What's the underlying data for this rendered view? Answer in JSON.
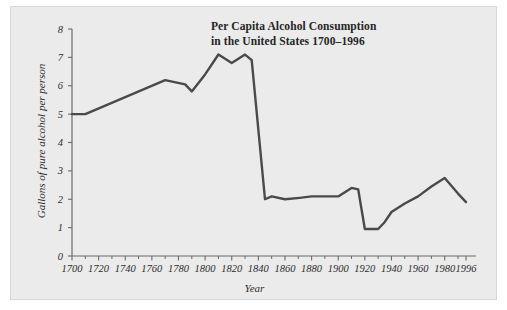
{
  "chart_data": {
    "type": "line",
    "title": "Per Capita Alcohol Consumption in the United States 1700–1996",
    "title_lines": [
      "Per Capita Alcohol Consumption",
      "in the United States 1700–1996"
    ],
    "xlabel": "Year",
    "ylabel": "Gallons of pure alcohol per person",
    "xlim": [
      1700,
      1996
    ],
    "ylim": [
      0,
      8
    ],
    "grid": false,
    "legend": null,
    "line_color": "#4a4a4a",
    "panel_color": "#ebebeb",
    "axis_color": "#6b6b6b",
    "xticks": [
      1700,
      1720,
      1740,
      1760,
      1780,
      1800,
      1820,
      1840,
      1860,
      1880,
      1900,
      1920,
      1940,
      1960,
      1980,
      1996
    ],
    "xtick_labels": [
      "1700",
      "1720",
      "1740",
      "1760",
      "1780",
      "1800",
      "1820",
      "1840",
      "1860",
      "1880",
      "1900",
      "1920",
      "1940",
      "1960",
      "1980",
      "1996"
    ],
    "yticks": [
      0,
      1,
      2,
      3,
      4,
      5,
      6,
      7,
      8
    ],
    "ytick_labels": [
      "0",
      "1",
      "2",
      "3",
      "4",
      "5",
      "6",
      "7",
      "8"
    ],
    "x": [
      1700,
      1710,
      1770,
      1785,
      1790,
      1800,
      1810,
      1820,
      1830,
      1835,
      1845,
      1850,
      1860,
      1871,
      1880,
      1890,
      1900,
      1910,
      1915,
      1920,
      1930,
      1935,
      1940,
      1950,
      1960,
      1970,
      1980,
      1990,
      1996
    ],
    "values": [
      5.0,
      5.0,
      6.2,
      6.05,
      5.8,
      6.4,
      7.1,
      6.8,
      7.1,
      6.9,
      2.0,
      2.1,
      2.0,
      2.05,
      2.1,
      2.1,
      2.1,
      2.4,
      2.35,
      0.95,
      0.95,
      1.2,
      1.55,
      1.85,
      2.1,
      2.45,
      2.75,
      2.2,
      1.9
    ]
  },
  "axis": {
    "x_title": "Year",
    "y_title": "Gallons of pure alcohol per person"
  }
}
